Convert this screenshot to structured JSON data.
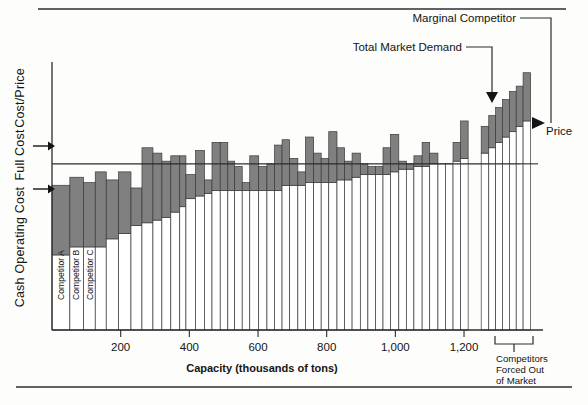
{
  "figure": {
    "background": "#fdfdfb",
    "rule_color": "#2c2c2c",
    "bar_fill": "#808080",
    "bar_stroke": "#3a3a3a",
    "white_fill": "#ffffff",
    "line_color": "#2c2c2c"
  },
  "axes": {
    "y_labels": [
      {
        "id": "cost-price",
        "text": "Cost/Price"
      },
      {
        "id": "full-cost",
        "text": "Full Cost"
      },
      {
        "id": "cash-operating-cost",
        "text": "Cash Operating Cost"
      }
    ],
    "x_title": "Capacity (thousands of tons)",
    "x_ticks": [
      "200",
      "400",
      "600",
      "800",
      "1,000",
      "1,200"
    ],
    "x_tick_values": [
      200,
      400,
      600,
      800,
      1000,
      1200
    ]
  },
  "annotations": {
    "marginal_competitor": "Marginal Competitor",
    "total_market_demand": "Total Market Demand",
    "price": "Price",
    "forced_out": "Competitors\nForced Out\nof Market",
    "forced_out_line1": "Competitors",
    "forced_out_line2": "Forced Out",
    "forced_out_line3": "of Market"
  },
  "competitor_labels": [
    {
      "id": "competitor-a",
      "text": "Competitor A"
    },
    {
      "id": "competitor-b",
      "text": "Competitor B"
    },
    {
      "id": "competitor-c",
      "text": "Competitor C"
    }
  ],
  "chart_data": {
    "type": "bar",
    "title": "",
    "subtitle": "",
    "xlabel": "Capacity (thousands of tons)",
    "ylabel": "Cost/Price",
    "grid": false,
    "legend": "none",
    "xlim": [
      0,
      1430
    ],
    "ylim": [
      0,
      100
    ],
    "price_level": 62,
    "total_market_demand_capacity": 1185,
    "marginal_competitor_index": 38,
    "series": [
      {
        "name": "Cash Operating Cost",
        "color": "#ffffff",
        "role": "lower-segment"
      },
      {
        "name": "Full Cost",
        "color": "#808080",
        "role": "upper-segment"
      }
    ],
    "bars": [
      {
        "i": 0,
        "x_start": 0,
        "width": 52,
        "cash_operating_cost": 28,
        "full_cost": 54
      },
      {
        "i": 1,
        "x_start": 52,
        "width": 40,
        "cash_operating_cost": 31,
        "full_cost": 57
      },
      {
        "i": 2,
        "x_start": 92,
        "width": 34,
        "cash_operating_cost": 31,
        "full_cost": 55
      },
      {
        "i": 3,
        "x_start": 126,
        "width": 32,
        "cash_operating_cost": 31,
        "full_cost": 59
      },
      {
        "i": 4,
        "x_start": 158,
        "width": 36,
        "cash_operating_cost": 34,
        "full_cost": 56
      },
      {
        "i": 5,
        "x_start": 194,
        "width": 36,
        "cash_operating_cost": 36,
        "full_cost": 59
      },
      {
        "i": 6,
        "x_start": 230,
        "width": 32,
        "cash_operating_cost": 39,
        "full_cost": 53
      },
      {
        "i": 7,
        "x_start": 262,
        "width": 32,
        "cash_operating_cost": 40,
        "full_cost": 68
      },
      {
        "i": 8,
        "x_start": 294,
        "width": 26,
        "cash_operating_cost": 41,
        "full_cost": 66
      },
      {
        "i": 9,
        "x_start": 320,
        "width": 26,
        "cash_operating_cost": 42,
        "full_cost": 63
      },
      {
        "i": 10,
        "x_start": 346,
        "width": 26,
        "cash_operating_cost": 44,
        "full_cost": 65
      },
      {
        "i": 11,
        "x_start": 372,
        "width": 18,
        "cash_operating_cost": 46,
        "full_cost": 65
      },
      {
        "i": 12,
        "x_start": 390,
        "width": 28,
        "cash_operating_cost": 49,
        "full_cost": 58
      },
      {
        "i": 13,
        "x_start": 418,
        "width": 26,
        "cash_operating_cost": 50,
        "full_cost": 67
      },
      {
        "i": 14,
        "x_start": 444,
        "width": 22,
        "cash_operating_cost": 51,
        "full_cost": 56
      },
      {
        "i": 15,
        "x_start": 466,
        "width": 24,
        "cash_operating_cost": 52,
        "full_cost": 70
      },
      {
        "i": 16,
        "x_start": 490,
        "width": 22,
        "cash_operating_cost": 52,
        "full_cost": 70
      },
      {
        "i": 17,
        "x_start": 512,
        "width": 20,
        "cash_operating_cost": 52,
        "full_cost": 63
      },
      {
        "i": 18,
        "x_start": 532,
        "width": 22,
        "cash_operating_cost": 52,
        "full_cost": 61
      },
      {
        "i": 19,
        "x_start": 554,
        "width": 22,
        "cash_operating_cost": 52,
        "full_cost": 55
      },
      {
        "i": 20,
        "x_start": 576,
        "width": 26,
        "cash_operating_cost": 52,
        "full_cost": 65
      },
      {
        "i": 21,
        "x_start": 602,
        "width": 24,
        "cash_operating_cost": 52,
        "full_cost": 61
      },
      {
        "i": 22,
        "x_start": 626,
        "width": 22,
        "cash_operating_cost": 52,
        "full_cost": 62
      },
      {
        "i": 23,
        "x_start": 648,
        "width": 22,
        "cash_operating_cost": 52,
        "full_cost": 69
      },
      {
        "i": 24,
        "x_start": 670,
        "width": 22,
        "cash_operating_cost": 54,
        "full_cost": 71
      },
      {
        "i": 25,
        "x_start": 692,
        "width": 24,
        "cash_operating_cost": 54,
        "full_cost": 64
      },
      {
        "i": 26,
        "x_start": 716,
        "width": 22,
        "cash_operating_cost": 54,
        "full_cost": 59
      },
      {
        "i": 27,
        "x_start": 738,
        "width": 24,
        "cash_operating_cost": 55,
        "full_cost": 72
      },
      {
        "i": 28,
        "x_start": 762,
        "width": 22,
        "cash_operating_cost": 55,
        "full_cost": 66
      },
      {
        "i": 29,
        "x_start": 784,
        "width": 22,
        "cash_operating_cost": 55,
        "full_cost": 64
      },
      {
        "i": 30,
        "x_start": 806,
        "width": 24,
        "cash_operating_cost": 55,
        "full_cost": 74
      },
      {
        "i": 31,
        "x_start": 830,
        "width": 22,
        "cash_operating_cost": 56,
        "full_cost": 68
      },
      {
        "i": 32,
        "x_start": 852,
        "width": 22,
        "cash_operating_cost": 56,
        "full_cost": 63
      },
      {
        "i": 33,
        "x_start": 874,
        "width": 24,
        "cash_operating_cost": 57,
        "full_cost": 66
      },
      {
        "i": 34,
        "x_start": 898,
        "width": 22,
        "cash_operating_cost": 58,
        "full_cost": 62
      },
      {
        "i": 35,
        "x_start": 920,
        "width": 22,
        "cash_operating_cost": 58,
        "full_cost": 61
      },
      {
        "i": 36,
        "x_start": 942,
        "width": 22,
        "cash_operating_cost": 58,
        "full_cost": 61
      },
      {
        "i": 37,
        "x_start": 964,
        "width": 22,
        "cash_operating_cost": 58,
        "full_cost": 68
      },
      {
        "i": 38,
        "x_start": 986,
        "width": 24,
        "cash_operating_cost": 59,
        "full_cost": 73
      },
      {
        "i": 39,
        "x_start": 1010,
        "width": 22,
        "cash_operating_cost": 60,
        "full_cost": 63
      },
      {
        "i": 40,
        "x_start": 1032,
        "width": 22,
        "cash_operating_cost": 60,
        "full_cost": 62
      },
      {
        "i": 41,
        "x_start": 1054,
        "width": 24,
        "cash_operating_cost": 61,
        "full_cost": 65
      },
      {
        "i": 42,
        "x_start": 1078,
        "width": 22,
        "cash_operating_cost": 61,
        "full_cost": 70
      },
      {
        "i": 43,
        "x_start": 1100,
        "width": 24,
        "cash_operating_cost": 62,
        "full_cost": 66
      },
      {
        "i": 44,
        "x_start": 1124,
        "width": 22,
        "cash_operating_cost": 62,
        "full_cost": 61
      },
      {
        "i": 45,
        "x_start": 1146,
        "width": 22,
        "cash_operating_cost": 62,
        "full_cost": 60
      },
      {
        "i": 46,
        "x_start": 1168,
        "width": 22,
        "cash_operating_cost": 63,
        "full_cost": 70
      },
      {
        "i": 47,
        "x_start": 1190,
        "width": 22,
        "cash_operating_cost": 64,
        "full_cost": 78
      }
    ],
    "forced_out_bars": [
      {
        "i": 0,
        "x_start": 1250,
        "width": 22,
        "cash_operating_cost": 66,
        "full_cost": 76
      },
      {
        "i": 1,
        "x_start": 1272,
        "width": 20,
        "cash_operating_cost": 68,
        "full_cost": 80
      },
      {
        "i": 2,
        "x_start": 1292,
        "width": 20,
        "cash_operating_cost": 70,
        "full_cost": 83
      },
      {
        "i": 3,
        "x_start": 1312,
        "width": 20,
        "cash_operating_cost": 72,
        "full_cost": 86
      },
      {
        "i": 4,
        "x_start": 1332,
        "width": 20,
        "cash_operating_cost": 74,
        "full_cost": 89
      },
      {
        "i": 5,
        "x_start": 1352,
        "width": 20,
        "cash_operating_cost": 76,
        "full_cost": 91
      },
      {
        "i": 6,
        "x_start": 1372,
        "width": 22,
        "cash_operating_cost": 78,
        "full_cost": 96
      }
    ]
  }
}
